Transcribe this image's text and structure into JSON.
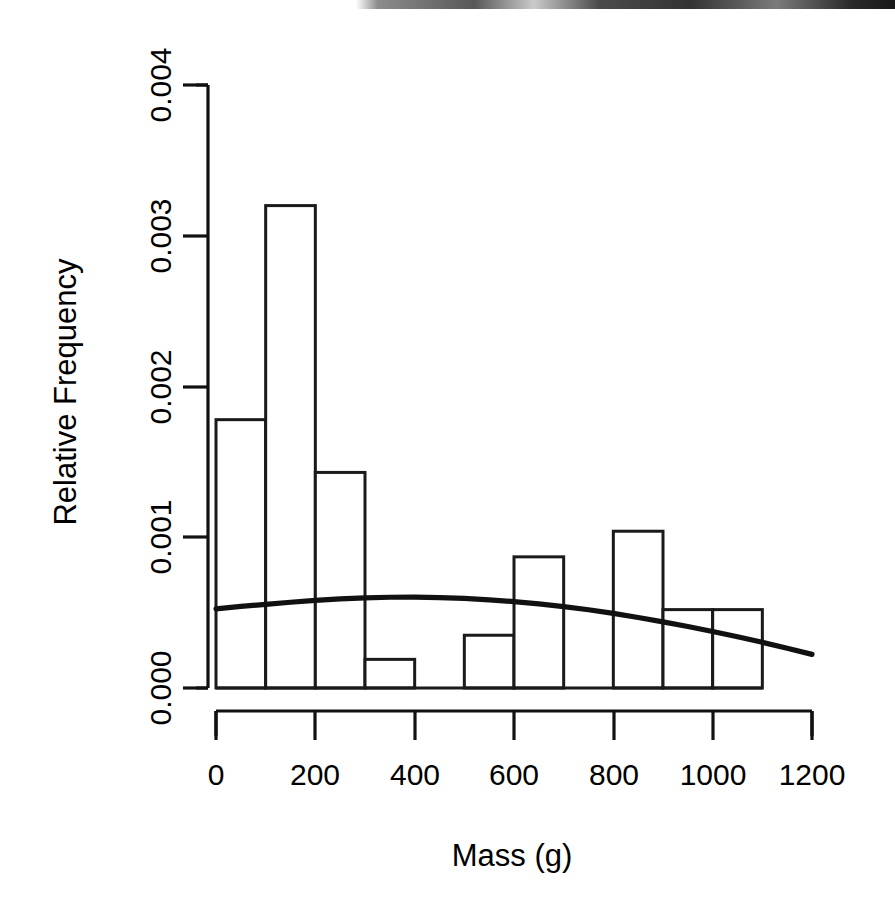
{
  "chart_data": {
    "type": "bar",
    "title": "",
    "subtitle": "",
    "xlabel": "Mass (g)",
    "ylabel": "Relative Frequency",
    "xlim": [
      0,
      1200
    ],
    "ylim": [
      0,
      0.004
    ],
    "grid": false,
    "legend": null,
    "bin_width": 100,
    "bin_edges": [
      0,
      100,
      200,
      300,
      400,
      500,
      600,
      700,
      800,
      900,
      1000,
      1100
    ],
    "categories": [
      "0-100",
      "100-200",
      "200-300",
      "300-400",
      "400-500",
      "500-600",
      "600-700",
      "700-800",
      "800-900",
      "900-1000",
      "1000-1100"
    ],
    "values": [
      0.00178,
      0.0032,
      0.00143,
      0.00019,
      0.0,
      0.00035,
      0.00087,
      0.0,
      0.00104,
      0.00052,
      0.00052
    ],
    "xticks": [
      0,
      200,
      400,
      600,
      800,
      1000,
      1200
    ],
    "xtick_labels": [
      "0",
      "200",
      "400",
      "600",
      "800",
      "1000",
      "1200"
    ],
    "yticks": [
      0.0,
      0.001,
      0.002,
      0.003,
      0.004
    ],
    "ytick_labels": [
      "0.000",
      "0.001",
      "0.002",
      "0.003",
      "0.004"
    ],
    "overlay_curve": {
      "name": "fitted density curve",
      "x": [
        0,
        50,
        100,
        150,
        200,
        250,
        300,
        350,
        400,
        450,
        500,
        550,
        600,
        650,
        700,
        750,
        800,
        850,
        900,
        950,
        1000,
        1050,
        1100,
        1150,
        1200
      ],
      "y": [
        0.000525,
        0.000541,
        0.000555,
        0.000569,
        0.000581,
        0.000591,
        0.000598,
        0.000602,
        0.000603,
        0.0006,
        0.000594,
        0.000585,
        0.000573,
        0.000558,
        0.00054,
        0.000519,
        0.000495,
        0.000468,
        0.000439,
        0.000408,
        0.000375,
        0.00034,
        0.000303,
        0.000264,
        0.000223
      ]
    },
    "colors": {
      "bar_fill": "#ffffff",
      "bar_stroke": "#1a1a1a",
      "curve": "#111111",
      "axis": "#111111",
      "text": "#000000",
      "background": "#ffffff"
    }
  }
}
